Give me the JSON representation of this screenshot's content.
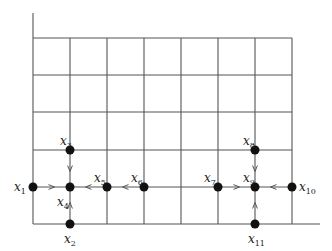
{
  "diagram": {
    "type": "grid-graph",
    "grid": {
      "x_lines": [
        33,
        70,
        107,
        144,
        181,
        218,
        255,
        292
      ],
      "y_lines": [
        38,
        75,
        112,
        150,
        187,
        224
      ],
      "axis_top": 13,
      "bottom_extend_to": 320,
      "color": "#555555"
    },
    "nodes": [
      {
        "id": "x1",
        "base": "x",
        "sub": "1",
        "x": 33,
        "y": 187,
        "lx": 14,
        "ly": 191
      },
      {
        "id": "x2",
        "base": "x",
        "sub": "2",
        "x": 70,
        "y": 224,
        "lx": 64,
        "ly": 243
      },
      {
        "id": "x3",
        "base": "x",
        "sub": "3",
        "x": 70,
        "y": 150,
        "lx": 60,
        "ly": 145
      },
      {
        "id": "x4",
        "base": "x",
        "sub": "4",
        "x": 70,
        "y": 187,
        "lx": 57,
        "ly": 206
      },
      {
        "id": "x5",
        "base": "x",
        "sub": "5",
        "x": 107,
        "y": 187,
        "lx": 94,
        "ly": 182
      },
      {
        "id": "x6",
        "base": "x",
        "sub": "6",
        "x": 144,
        "y": 187,
        "lx": 131,
        "ly": 182
      },
      {
        "id": "x7",
        "base": "x",
        "sub": "7",
        "x": 218,
        "y": 187,
        "lx": 204,
        "ly": 182
      },
      {
        "id": "x8",
        "base": "x",
        "sub": "8",
        "x": 255,
        "y": 150,
        "lx": 243,
        "ly": 145
      },
      {
        "id": "x9",
        "base": "x",
        "sub": "9",
        "x": 255,
        "y": 187,
        "lx": 243,
        "ly": 182
      },
      {
        "id": "x10",
        "base": "x",
        "sub": "10",
        "x": 292,
        "y": 187,
        "lx": 299,
        "ly": 191
      },
      {
        "id": "x11",
        "base": "x",
        "sub": "11",
        "x": 255,
        "y": 224,
        "lx": 248,
        "ly": 243
      }
    ],
    "edges": [
      {
        "from": "x1",
        "to": "x4",
        "directed": true
      },
      {
        "from": "x3",
        "to": "x4",
        "directed": true
      },
      {
        "from": "x2",
        "to": "x4",
        "directed": true
      },
      {
        "from": "x5",
        "to": "x4",
        "directed": true
      },
      {
        "from": "x6",
        "to": "x5",
        "directed": true
      },
      {
        "from": "x7",
        "to": "x9",
        "directed": true
      },
      {
        "from": "x8",
        "to": "x9",
        "directed": true
      },
      {
        "from": "x10",
        "to": "x9",
        "directed": true
      },
      {
        "from": "x11",
        "to": "x9",
        "directed": true
      }
    ]
  }
}
